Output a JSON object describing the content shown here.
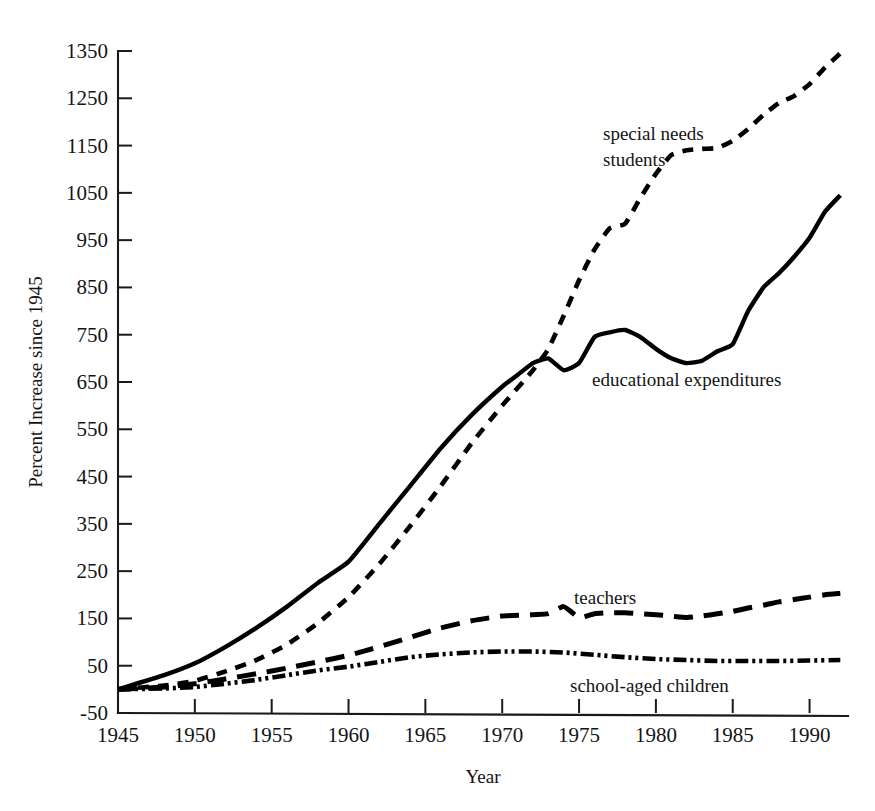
{
  "chart_data": {
    "type": "line",
    "title": "",
    "xlabel": "Year",
    "ylabel": "Percent Increase since 1945",
    "xlim": [
      1945,
      1992.5
    ],
    "ylim": [
      -50,
      1350
    ],
    "grid": false,
    "legend_position": "inline-annotations",
    "x_ticks": [
      1945,
      1950,
      1955,
      1960,
      1965,
      1970,
      1975,
      1980,
      1985,
      1990
    ],
    "x_tick_labels": [
      "1945",
      "1950",
      "1955",
      "1960",
      "1965",
      "1970",
      "1975",
      "1980",
      "1985",
      "1990"
    ],
    "y_ticks": [
      -50,
      50,
      150,
      250,
      350,
      450,
      550,
      650,
      750,
      850,
      950,
      1050,
      1150,
      1250,
      1350
    ],
    "y_tick_labels": [
      "-50",
      "50",
      "150",
      "250",
      "350",
      "450",
      "550",
      "650",
      "750",
      "850",
      "950",
      "1050",
      "1150",
      "1250",
      "1350"
    ],
    "series": [
      {
        "name": "special needs students",
        "label": "special needs students",
        "label_lines": [
          "special needs",
          "students"
        ],
        "style": "dashed",
        "color": "#000000",
        "x": [
          1945,
          1948,
          1950,
          1952,
          1954,
          1956,
          1958,
          1960,
          1962,
          1964,
          1966,
          1968,
          1970,
          1972,
          1973,
          1974,
          1975,
          1976,
          1977,
          1978,
          1979,
          1980,
          1981,
          1982,
          1983,
          1984,
          1985,
          1986,
          1987,
          1988,
          1989,
          1990,
          1991,
          1992
        ],
        "y": [
          0,
          8,
          18,
          38,
          62,
          95,
          140,
          195,
          265,
          345,
          430,
          520,
          600,
          675,
          720,
          790,
          865,
          930,
          975,
          985,
          1040,
          1090,
          1130,
          1140,
          1143,
          1145,
          1160,
          1185,
          1215,
          1240,
          1255,
          1280,
          1315,
          1345
        ]
      },
      {
        "name": "educational expenditures",
        "label": "educational expenditures",
        "label_lines": [
          "educational expenditures"
        ],
        "style": "solid",
        "color": "#000000",
        "x": [
          1945,
          1948,
          1950,
          1952,
          1954,
          1956,
          1958,
          1960,
          1962,
          1964,
          1966,
          1968,
          1970,
          1971,
          1972,
          1973,
          1974,
          1975,
          1976,
          1977,
          1978,
          1979,
          1980,
          1981,
          1982,
          1983,
          1984,
          1985,
          1986,
          1987,
          1988,
          1989,
          1990,
          1991,
          1992
        ],
        "y": [
          0,
          30,
          55,
          90,
          130,
          175,
          225,
          270,
          350,
          430,
          510,
          580,
          640,
          665,
          690,
          700,
          675,
          690,
          745,
          755,
          760,
          745,
          720,
          700,
          690,
          695,
          715,
          730,
          800,
          850,
          880,
          915,
          955,
          1010,
          1045
        ]
      },
      {
        "name": "teachers",
        "label": "teachers",
        "label_lines": [
          "teachers"
        ],
        "style": "long-dashed",
        "color": "#000000",
        "x": [
          1945,
          1948,
          1950,
          1952,
          1954,
          1956,
          1958,
          1960,
          1962,
          1964,
          1966,
          1968,
          1970,
          1972,
          1973,
          1974,
          1975,
          1976,
          1977,
          1978,
          1979,
          1980,
          1981,
          1982,
          1983,
          1984,
          1985,
          1986,
          1987,
          1988,
          1989,
          1990,
          1991,
          1992
        ],
        "y": [
          0,
          5,
          12,
          22,
          33,
          45,
          58,
          72,
          90,
          110,
          130,
          145,
          155,
          158,
          160,
          175,
          152,
          160,
          162,
          162,
          160,
          158,
          155,
          152,
          155,
          160,
          165,
          172,
          178,
          185,
          190,
          195,
          200,
          203
        ]
      },
      {
        "name": "school-aged children",
        "label": "school-aged children",
        "label_lines": [
          "school-aged children"
        ],
        "style": "dash-dot-dot",
        "color": "#000000",
        "x": [
          1945,
          1948,
          1950,
          1952,
          1954,
          1956,
          1958,
          1960,
          1962,
          1964,
          1966,
          1968,
          1970,
          1972,
          1974,
          1976,
          1978,
          1980,
          1982,
          1984,
          1986,
          1988,
          1990,
          1992
        ],
        "y": [
          0,
          2,
          5,
          12,
          20,
          30,
          40,
          48,
          58,
          68,
          74,
          78,
          80,
          80,
          78,
          73,
          68,
          64,
          62,
          60,
          60,
          60,
          61,
          62
        ]
      }
    ]
  },
  "axes": {
    "x_title": "Year",
    "y_title": "Percent Increase since 1945"
  }
}
